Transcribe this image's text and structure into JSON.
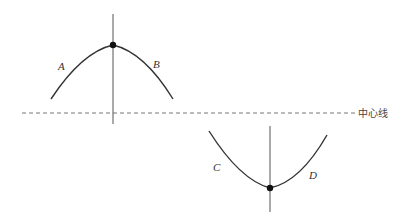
{
  "diagram": {
    "center_line_label": "中心线",
    "upper_curve": {
      "left_label": "A",
      "right_label": "B"
    },
    "lower_curve": {
      "left_label": "C",
      "right_label": "D"
    },
    "colors": {
      "line": "#333333",
      "axis": "#555555",
      "dashed": "#777777"
    }
  }
}
